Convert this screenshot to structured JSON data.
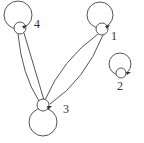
{
  "diagram": {
    "type": "directed-graph",
    "stroke_color": "#555555",
    "nodes": [
      {
        "id": "1",
        "label": "1"
      },
      {
        "id": "2",
        "label": "2"
      },
      {
        "id": "3",
        "label": "3"
      },
      {
        "id": "4",
        "label": "4"
      }
    ],
    "edges": [
      {
        "from": "1",
        "to": "1",
        "kind": "self-loop"
      },
      {
        "from": "2",
        "to": "2",
        "kind": "self-loop"
      },
      {
        "from": "3",
        "to": "3",
        "kind": "self-loop"
      },
      {
        "from": "4",
        "to": "4",
        "kind": "self-loop"
      },
      {
        "from": "4",
        "to": "3"
      },
      {
        "from": "3",
        "to": "4"
      },
      {
        "from": "1",
        "to": "3"
      },
      {
        "from": "3",
        "to": "1"
      }
    ]
  }
}
